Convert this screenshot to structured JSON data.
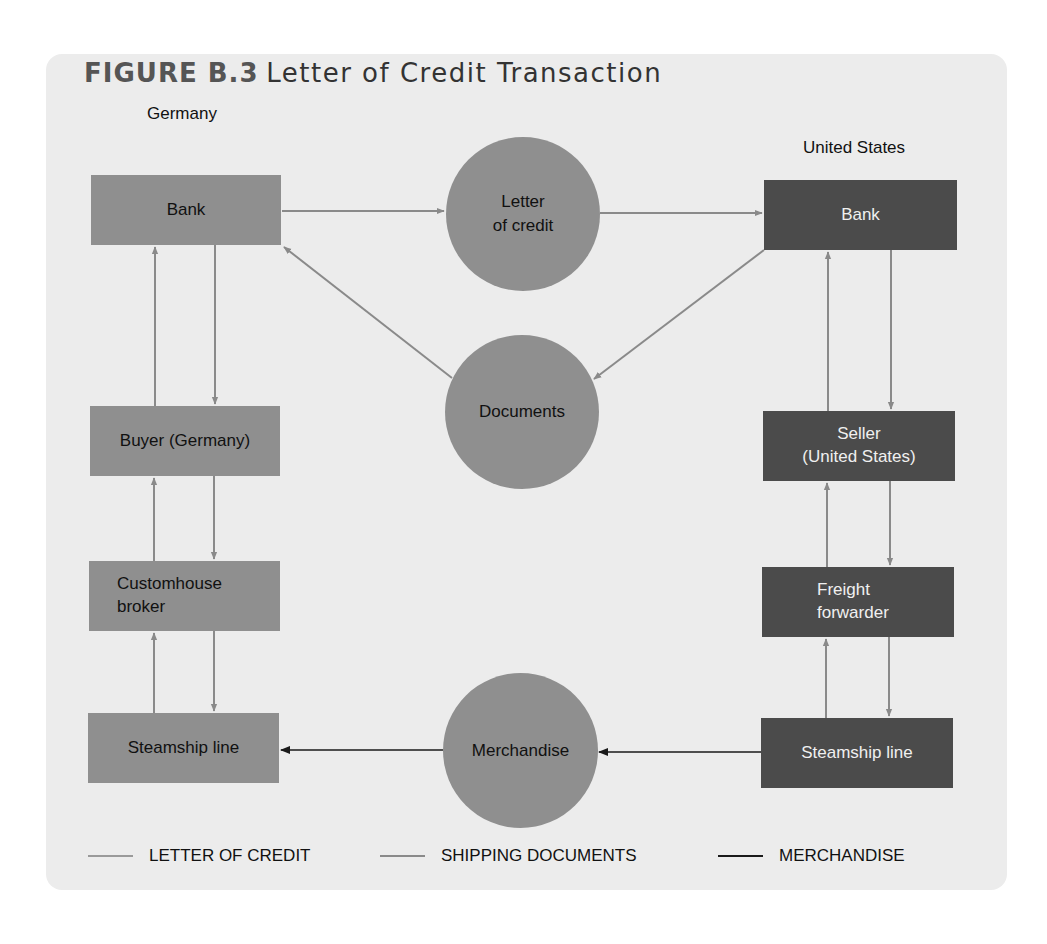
{
  "figure": {
    "number": "FIGURE B.3",
    "title": "Letter of Credit Transaction"
  },
  "regions": {
    "left": "Germany",
    "right": "United States"
  },
  "nodes": {
    "germany_bank": "Bank",
    "buyer": "Buyer (Germany)",
    "customhouse_broker_line1": "Customhouse",
    "customhouse_broker_line2": "broker",
    "germany_steamship": "Steamship line",
    "us_bank": "Bank",
    "seller_line1": "Seller",
    "seller_line2": "(United States)",
    "freight_forwarder_line1": "Freight",
    "freight_forwarder_line2": "forwarder",
    "us_steamship": "Steamship line"
  },
  "circles": {
    "letter_of_credit_line1": "Letter",
    "letter_of_credit_line2": "of credit",
    "documents": "Documents",
    "merchandise": "Merchandise"
  },
  "legend": [
    {
      "label": "LETTER OF CREDIT",
      "color": "#9a9a9a"
    },
    {
      "label": "SHIPPING DOCUMENTS",
      "color": "#8a8a8a"
    },
    {
      "label": "MERCHANDISE",
      "color": "#1a1a1a"
    }
  ],
  "colors": {
    "panel_bg": "#ececec",
    "light_box": "#8f8f8f",
    "dark_box": "#4b4b4b",
    "flow_line": "#8a8a8a",
    "merchandise_line": "#1a1a1a"
  }
}
